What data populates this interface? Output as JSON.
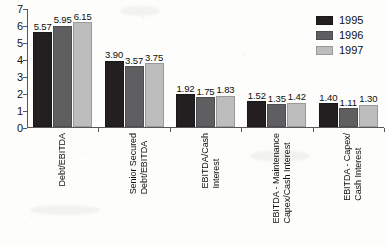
{
  "chart_data": {
    "type": "bar",
    "title": "",
    "xlabel": "",
    "ylabel": "",
    "ylim": [
      0,
      7
    ],
    "yticks": [
      "0",
      "1",
      "2",
      "3",
      "4",
      "5",
      "6",
      "7"
    ],
    "grid": false,
    "legend_position": "top-right",
    "categories": [
      "Debt/EBITDA",
      "Senior Secured\nDebt/EBITDA",
      "EBITDA/Cash\nInterest",
      "EBITDA - Maintenance\nCapex/Cash Interest",
      "EBITDA - Capex/\nCash Interest"
    ],
    "series": [
      {
        "name": "1995",
        "color": "#231f20",
        "values": [
          5.57,
          3.9,
          1.92,
          1.52,
          1.4
        ],
        "labels": [
          "5.57",
          "3.90",
          "1.92",
          "1.52",
          "1.40"
        ]
      },
      {
        "name": "1996",
        "color": "#5f5f61",
        "values": [
          5.95,
          3.57,
          1.75,
          1.35,
          1.11
        ],
        "labels": [
          "5.95",
          "3.57",
          "1.75",
          "1.35",
          "1.11"
        ]
      },
      {
        "name": "1997",
        "color": "#bdbdbd",
        "values": [
          6.15,
          3.75,
          1.83,
          1.42,
          1.3
        ],
        "labels": [
          "6.15",
          "3.75",
          "1.83",
          "1.42",
          "1.30"
        ]
      }
    ]
  },
  "legend": {
    "items": [
      {
        "label": "1995",
        "swatch": "legend-swatch-1995"
      },
      {
        "label": "1996",
        "swatch": "legend-swatch-1996"
      },
      {
        "label": "1997",
        "swatch": "legend-swatch-1997"
      }
    ]
  }
}
